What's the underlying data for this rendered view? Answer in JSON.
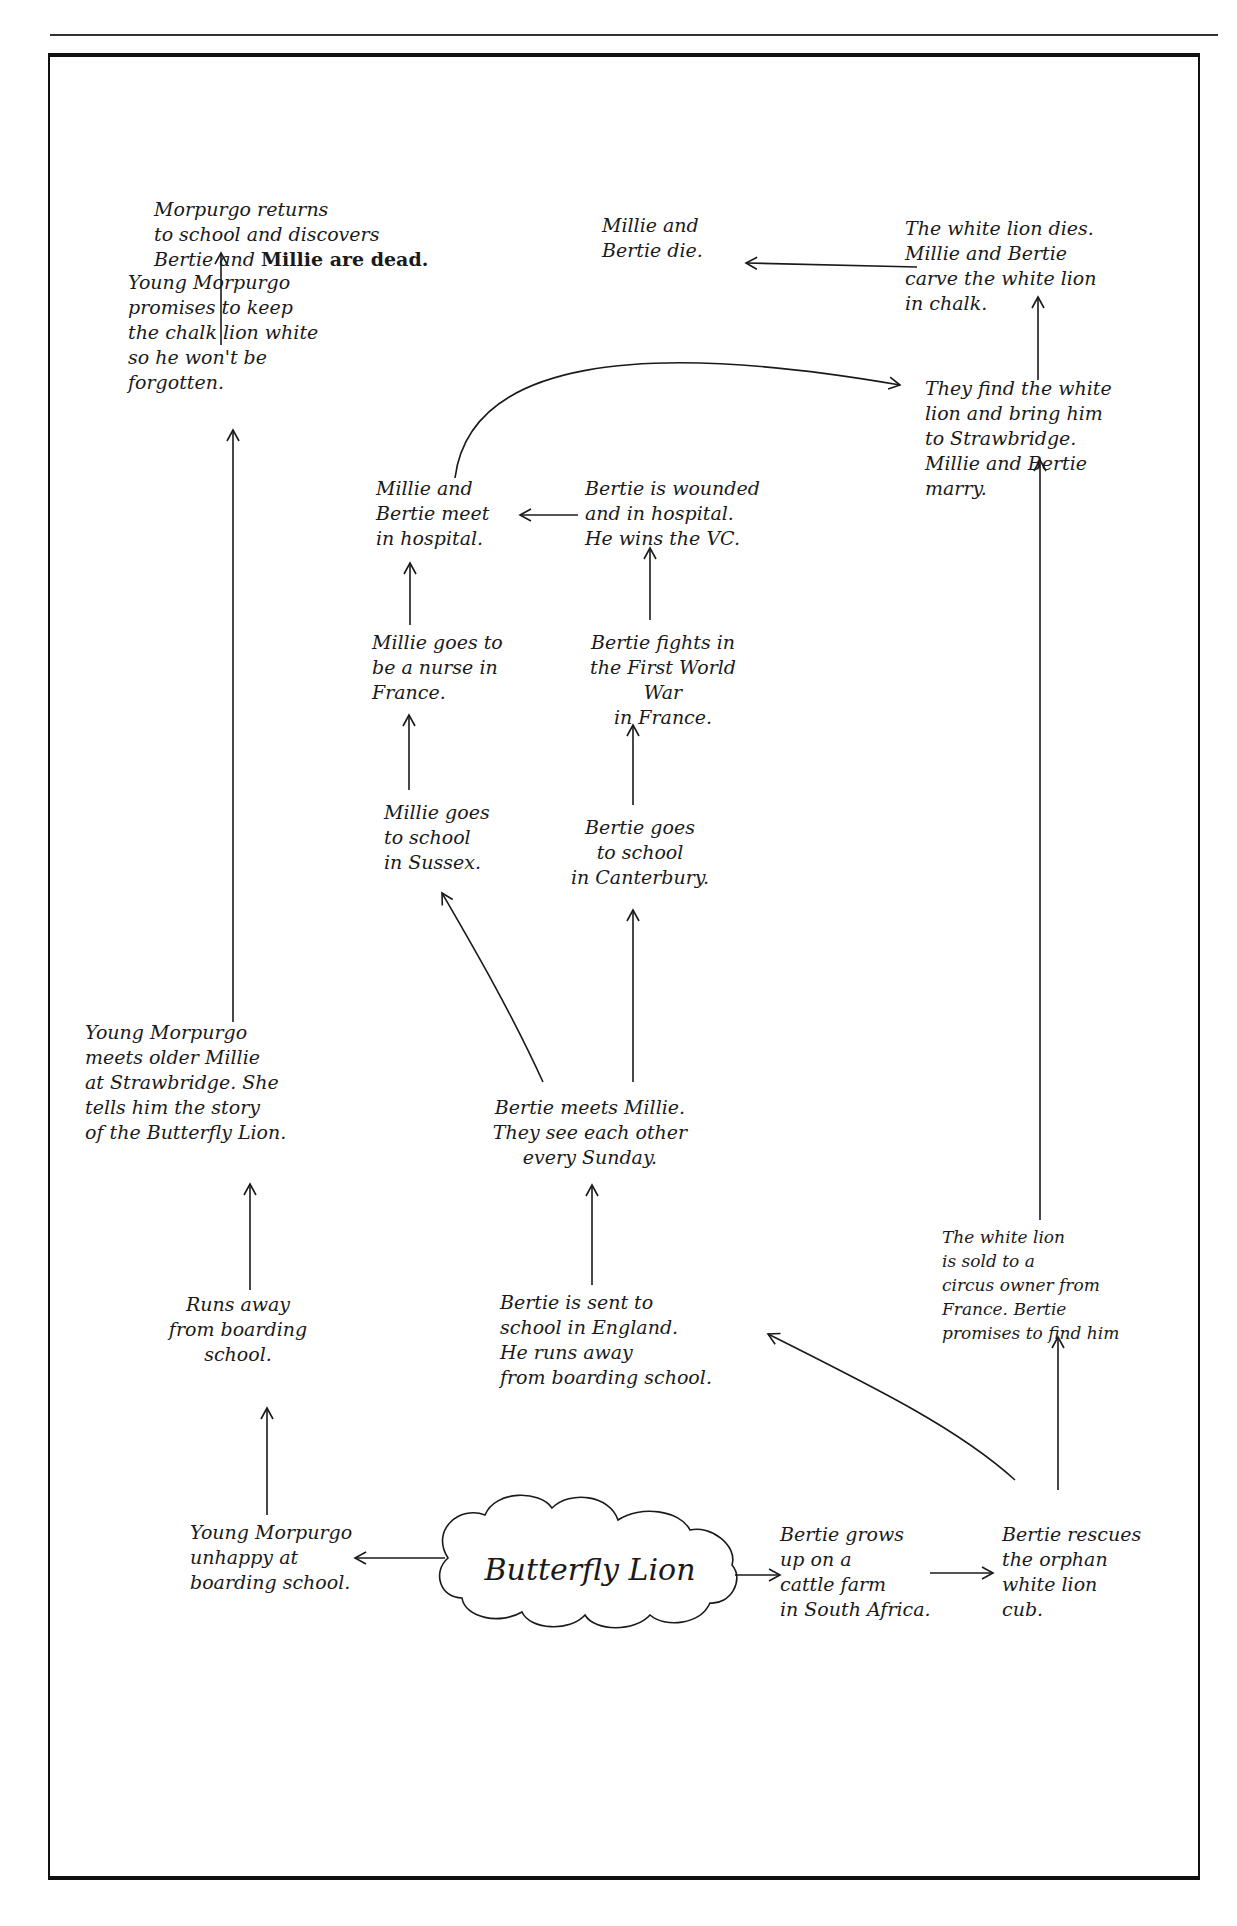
{
  "diagram": {
    "center": "Butterfly Lion",
    "nodes": {
      "morpurgo_returns": {
        "pre": "Morpurgo returns\nto school and discovers\nBertie and ",
        "bold": "Millie are dead."
      },
      "young_promises": "Young Morpurgo\npromises to keep\nthe chalk lion white\nso he won't be\nforgotten.",
      "millie_bertie_die": "Millie and\nBertie die.",
      "white_lion_dies": "The white lion dies.\nMillie and Bertie\ncarve the white lion\nin chalk.",
      "find_white_lion": "They find the white\nlion and bring him\nto Strawbridge.\nMillie and Bertie\nmarry.",
      "meet_in_hospital": "Millie and\nBertie meet\nin hospital.",
      "bertie_wounded": "Bertie is wounded\nand in hospital.\nHe wins the VC.",
      "millie_nurse": "Millie goes to\nbe a nurse in\nFrance.",
      "bertie_fights": "Bertie fights in\nthe First World War\nin France.",
      "millie_school": "Millie goes\nto school\nin Sussex.",
      "bertie_school": "Bertie goes\nto school\nin Canterbury.",
      "young_meets_millie": "Young Morpurgo\nmeets older Millie\nat Strawbridge. She\ntells him the story\nof the Butterfly Lion.",
      "bertie_meets_millie": "Bertie meets Millie.\nThey see each other\nevery Sunday.",
      "runs_away": "Runs away\nfrom boarding\nschool.",
      "bertie_sent": "Bertie is sent to\nschool in England.\nHe runs away\nfrom boarding school.",
      "white_lion_sold": "The white lion\nis sold to a\ncircus owner from\nFrance. Bertie\npromises to find him",
      "young_unhappy": "Young Morpurgo\nunhappy at\nboarding school.",
      "bertie_grows": "Bertie grows\nup on a\ncattle farm\nin South Africa.",
      "bertie_rescues": "Bertie rescues\nthe orphan\nwhite lion\ncub."
    }
  }
}
